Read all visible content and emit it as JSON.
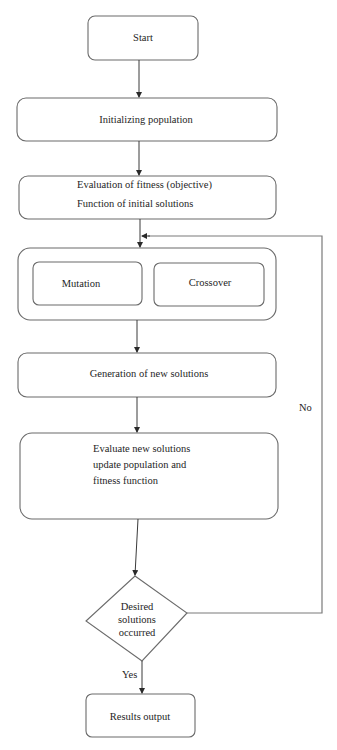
{
  "diagram": {
    "type": "flowchart",
    "nodes": {
      "start": {
        "label": "Start",
        "shape": "rounded-rect"
      },
      "init": {
        "label": "Initializing population",
        "shape": "rounded-rect"
      },
      "eval_initial": {
        "line1": "Evaluation of fitness (objective)",
        "line2": "Function of initial solutions",
        "shape": "rounded-rect"
      },
      "operators": {
        "shape": "rounded-rect-group",
        "mutation": {
          "label": "Mutation",
          "shape": "rounded-rect"
        },
        "crossover": {
          "label": "Crossover",
          "shape": "rounded-rect"
        }
      },
      "generation": {
        "label": "Generation of new solutions",
        "shape": "rounded-rect"
      },
      "evaluate_new": {
        "line1": "Evaluate new solutions",
        "line2": "update population and",
        "line3": "fitness function",
        "shape": "rounded-rect"
      },
      "decision": {
        "line1": "Desired",
        "line2": "solutions",
        "line3": "occurred",
        "shape": "diamond"
      },
      "results": {
        "label": "Results output",
        "shape": "rounded-rect"
      }
    },
    "edges": {
      "yes_label": "Yes",
      "no_label": "No"
    },
    "colors": {
      "stroke": "#6b6b6b",
      "arrow": "#3a3a3a",
      "text": "#1e1e1e",
      "background": "#ffffff"
    }
  }
}
